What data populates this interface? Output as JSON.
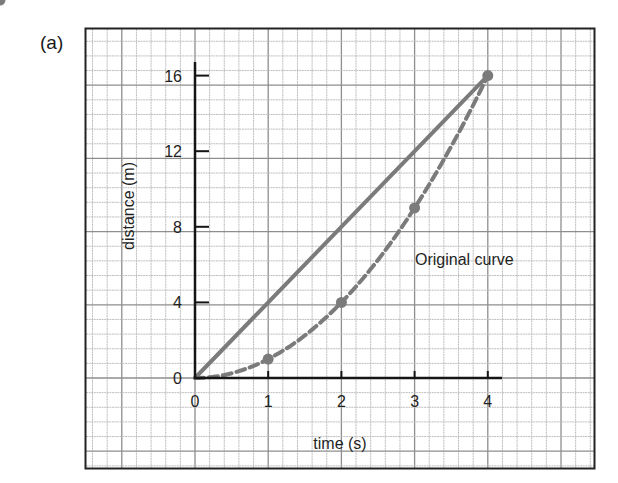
{
  "panel_label": "(a)",
  "colors": {
    "axis": "#151515",
    "frame": "#222222",
    "grid_minor": "#b9b9b9",
    "grid_major": "#8e8e8e",
    "series": "#7b7b7b",
    "text": "#1f1f1f"
  },
  "chart_data": {
    "type": "line",
    "title": "",
    "xlabel": "time (s)",
    "ylabel": "distance (m)",
    "xlim": [
      0,
      4
    ],
    "ylim": [
      0,
      16
    ],
    "x_ticks": [
      0,
      1,
      2,
      3,
      4
    ],
    "y_ticks": [
      0,
      4,
      8,
      12,
      16
    ],
    "x_tick_labels": [
      "0",
      "1",
      "2",
      "3",
      "4"
    ],
    "y_tick_labels": [
      "0",
      "4",
      "8",
      "12",
      "16"
    ],
    "grid": true,
    "legend": null,
    "annotations": [
      {
        "text": "Original curve",
        "x": 3.0,
        "y": 6.3
      }
    ],
    "series": [
      {
        "name": "Straight line (average)",
        "style": "solid",
        "x": [
          0,
          4
        ],
        "y": [
          0,
          16
        ],
        "markers": [
          4
        ]
      },
      {
        "name": "Original curve",
        "style": "dashed",
        "x": [
          0,
          1,
          2,
          3,
          4
        ],
        "y": [
          0,
          1,
          4,
          9,
          16
        ],
        "markers": [
          1,
          2,
          3,
          4
        ]
      }
    ]
  }
}
